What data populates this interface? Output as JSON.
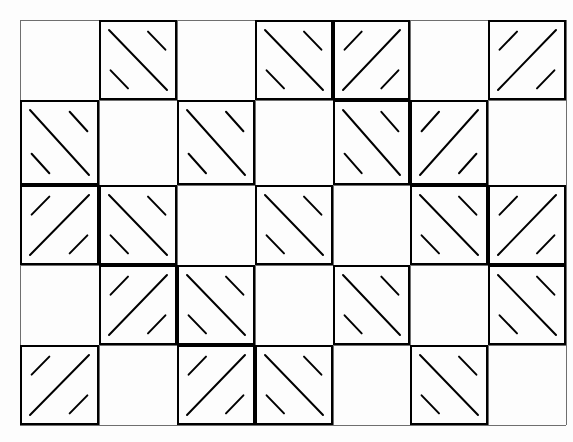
{
  "figure": {
    "type": "grid-diagram",
    "width": 573,
    "height": 442,
    "background_color": "#fdfdfd",
    "line_color": "#000000",
    "grid_line_color": "#6f6f6f",
    "grid_line_width": 1,
    "cell_border_width": 2,
    "hatch_line_width": 2
  },
  "grid": {
    "columns": 7,
    "rows": 5,
    "x_positions": [
      20,
      99,
      177,
      255,
      333,
      410,
      488,
      566
    ],
    "y_positions": [
      20,
      100,
      185,
      265,
      345,
      425
    ],
    "cell_width": 78,
    "cell_height": 80
  },
  "legend": {
    "backslash_symbol": "\\",
    "slash_symbol": "/",
    "empty_symbol": "."
  },
  "chart_data": {
    "type": "heatmap",
    "xlabel": "",
    "ylabel": "",
    "categories": [
      "c0",
      "c1",
      "c2",
      "c3",
      "c4",
      "c5",
      "c6"
    ],
    "row_labels": [
      "r0",
      "r1",
      "r2",
      "r3",
      "r4"
    ],
    "cells": [
      [
        "empty",
        "backslash",
        "empty",
        "backslash",
        "slash",
        "empty",
        "slash"
      ],
      [
        "backslash",
        "empty",
        "backslash",
        "empty",
        "backslash",
        "slash",
        "empty"
      ],
      [
        "slash",
        "backslash",
        "empty",
        "backslash",
        "empty",
        "backslash",
        "slash"
      ],
      [
        "empty",
        "slash",
        "backslash",
        "empty",
        "backslash",
        "empty",
        "backslash"
      ],
      [
        "slash",
        "empty",
        "slash",
        "backslash",
        "empty",
        "backslash",
        "empty"
      ]
    ],
    "counts": {
      "backslash": 12,
      "slash": 7,
      "empty": 16,
      "total": 35
    }
  }
}
